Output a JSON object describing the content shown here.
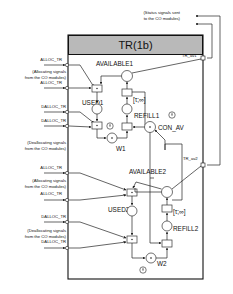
{
  "title": "TR(1b)",
  "status_note": [
    "(Status signals sent",
    "to the CO modules)"
  ],
  "inputs": [
    {
      "label": "ALLOC_TR"
    },
    {
      "label": "ALLOC_TR"
    },
    {
      "label": "DALLOC_TR"
    },
    {
      "label": "DALLOC_TR"
    },
    {
      "label": "ALLOC_TR"
    },
    {
      "label": "ALLOC_TR"
    },
    {
      "label": "DALLOC_TR"
    },
    {
      "label": "DALLOC_TR"
    }
  ],
  "notes": {
    "alloc1": [
      "(Allocating signals",
      "from the CO modules)"
    ],
    "dealloc1": [
      "(Deallocating signals",
      "from the CO modules)"
    ],
    "alloc2": [
      "(Allocating signals",
      "from the CO modules)"
    ],
    "dealloc2": [
      "(Deallocating signals",
      "from the CO modules)"
    ]
  },
  "places": {
    "available1": "AVAILABLE1",
    "used1": "USED1",
    "refill1": "REFILL1",
    "con_av": "CON_AV",
    "w1": "W1",
    "available2": "AVAILABLE2",
    "used2": "USED2",
    "refill2": "REFILL2",
    "w2": "W2"
  },
  "outputs": {
    "tr_av1": "TR_av1",
    "tr_av2": "TR_av2"
  },
  "intervals": {
    "refill1": "[τ;∞]",
    "refill2": "[τ;∞]"
  }
}
